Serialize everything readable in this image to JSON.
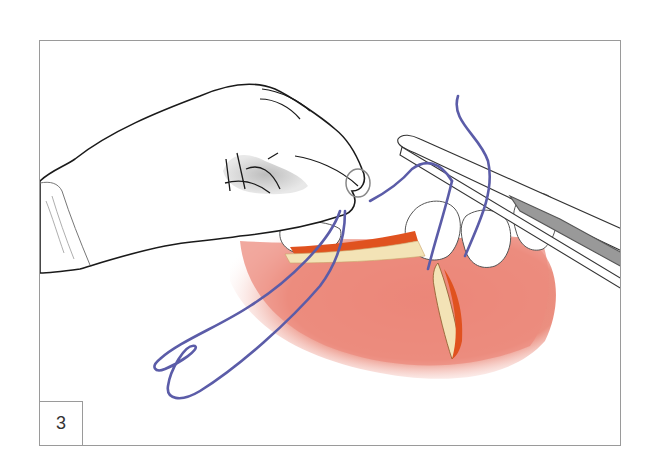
{
  "figure": {
    "step_number": "3",
    "colors": {
      "frame_border": "#9a9a9a",
      "gum": "#e8857a",
      "gum_light": "#f4b3a6",
      "incision_edge": "#e0521f",
      "incision_bone": "#f3e3b6",
      "suture": "#5b5ca8",
      "glove": "#ffffff",
      "glove_shadow": "#d9d9d9",
      "tooth": "#ffffff",
      "instrument": "#ffffff",
      "outline": "#1a1a1a"
    }
  }
}
